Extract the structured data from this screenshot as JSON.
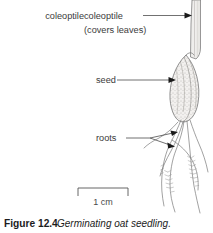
{
  "figure": {
    "labels": [
      {
        "id": "coleoptile",
        "line1": "coleoptile",
        "line2": "(covers leaves)"
      },
      {
        "id": "seed",
        "line1": "seed"
      },
      {
        "id": "roots",
        "line1": "roots"
      }
    ],
    "scale_bar": {
      "label": "1 cm"
    },
    "caption": {
      "number": "Figure 12.4",
      "text": "Germinating oat seedling."
    },
    "colors": {
      "background": "#ffffff",
      "label_text": "#3b3b3b",
      "caption_text": "#1c1c1c",
      "leader_line": "#4d4d4d",
      "arrowhead": "#1a1a1a",
      "drawing_line": "#6e6e6e",
      "stipple": "#909090",
      "scale_bar": "#555555"
    }
  }
}
